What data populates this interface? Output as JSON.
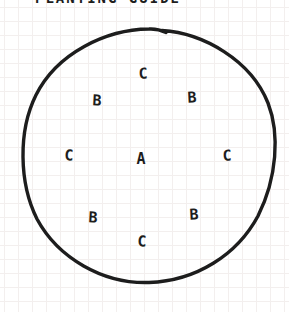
{
  "title": "PLANTING GUIDE",
  "colors": {
    "ink": "#1d1d1d",
    "paper": "#ffffff",
    "grid": "#f3efee"
  },
  "diagram": {
    "shape": "hand-drawn circle (planting bed outline)",
    "circle": {
      "cx": 148,
      "cy": 156,
      "r": 127
    },
    "labels": [
      {
        "text": "C",
        "x": 143,
        "y": 74,
        "position": "top"
      },
      {
        "text": "B",
        "x": 97,
        "y": 101,
        "position": "upper-left"
      },
      {
        "text": "B",
        "x": 192,
        "y": 98,
        "position": "upper-right"
      },
      {
        "text": "C",
        "x": 69,
        "y": 156,
        "position": "left"
      },
      {
        "text": "A",
        "x": 141,
        "y": 159,
        "position": "center"
      },
      {
        "text": "C",
        "x": 227,
        "y": 156,
        "position": "right"
      },
      {
        "text": "B",
        "x": 93,
        "y": 218,
        "position": "lower-left"
      },
      {
        "text": "B",
        "x": 194,
        "y": 215,
        "position": "lower-right"
      },
      {
        "text": "C",
        "x": 142,
        "y": 242,
        "position": "bottom"
      }
    ]
  }
}
